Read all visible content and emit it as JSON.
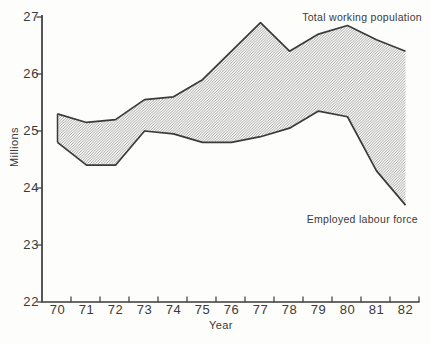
{
  "figure": {
    "background": "#fdfdfb",
    "ink_color": "#3a3a3a",
    "hatch_color": "#909090"
  },
  "chart_data": {
    "type": "area",
    "subtype": "hatched-band-between-two-lines",
    "title": "",
    "xlabel": "Year",
    "ylabel": "Millions",
    "categories": [
      "70",
      "71",
      "72",
      "73",
      "74",
      "75",
      "76",
      "77",
      "78",
      "79",
      "80",
      "81",
      "82"
    ],
    "series": [
      {
        "name": "Total working population",
        "values": [
          25.3,
          25.15,
          25.2,
          25.55,
          25.6,
          25.9,
          26.4,
          26.9,
          26.4,
          26.7,
          26.85,
          26.6,
          26.4
        ]
      },
      {
        "name": "Employed labour force",
        "values": [
          24.8,
          24.4,
          24.4,
          25.0,
          24.95,
          24.8,
          24.8,
          24.9,
          25.05,
          25.35,
          25.25,
          24.3,
          23.7
        ]
      }
    ],
    "ylim": [
      22,
      27
    ],
    "yticks": [
      27,
      26,
      25,
      24,
      23,
      22
    ],
    "grid": false,
    "fill": "diagonal-hatch",
    "legend_position": "inline-annotations"
  }
}
